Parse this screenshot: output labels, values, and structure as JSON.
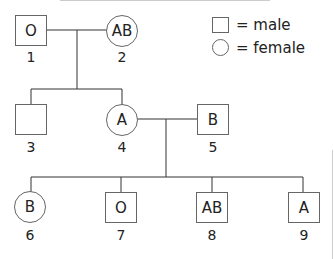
{
  "legend": {
    "male_label": "= male",
    "female_label": "= female"
  },
  "individuals": [
    {
      "id": "1",
      "sex": "male",
      "blood_type": "O"
    },
    {
      "id": "2",
      "sex": "female",
      "blood_type": "AB"
    },
    {
      "id": "3",
      "sex": "male",
      "blood_type": ""
    },
    {
      "id": "4",
      "sex": "female",
      "blood_type": "A"
    },
    {
      "id": "5",
      "sex": "male",
      "blood_type": "B"
    },
    {
      "id": "6",
      "sex": "female",
      "blood_type": "B"
    },
    {
      "id": "7",
      "sex": "male",
      "blood_type": "O"
    },
    {
      "id": "8",
      "sex": "male",
      "blood_type": "AB"
    },
    {
      "id": "9",
      "sex": "male",
      "blood_type": "A"
    }
  ],
  "relationships": {
    "couples": [
      [
        "1",
        "2"
      ],
      [
        "4",
        "5"
      ]
    ],
    "children": {
      "1+2": [
        "3",
        "4"
      ],
      "4+5": [
        "6",
        "7",
        "8",
        "9"
      ]
    }
  },
  "colors": {
    "stroke": "#666666",
    "line": "#333333",
    "text": "#222222"
  }
}
